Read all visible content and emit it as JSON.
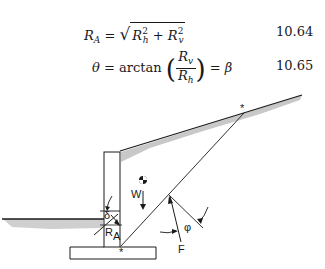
{
  "equations": [
    {
      "id": "10.64",
      "lhs": "R",
      "lhs_sub": "A",
      "rel": "=",
      "rad_a": "R",
      "rad_a_sub": "h",
      "rad_a_sup": "2",
      "plus": "+",
      "rad_b": "R",
      "rad_b_sub": "v",
      "rad_b_sup": "2",
      "number": "10.64"
    },
    {
      "id": "10.65",
      "lhs": "θ",
      "rel": "=",
      "func": "arctan",
      "num": "R",
      "num_sub": "v",
      "den": "R",
      "den_sub": "h",
      "rel2": "=",
      "rhs": "β",
      "number": "10.65"
    }
  ],
  "figure": {
    "labels": {
      "weight": "W",
      "delta": "δ",
      "resultant": "R",
      "resultant_sub": "A",
      "phi": "φ",
      "force": "F",
      "crest_marker": "*",
      "heel_marker": "*"
    },
    "colors": {
      "line": "#1a1a1a",
      "soil_shade": "#c8c8c8"
    }
  }
}
